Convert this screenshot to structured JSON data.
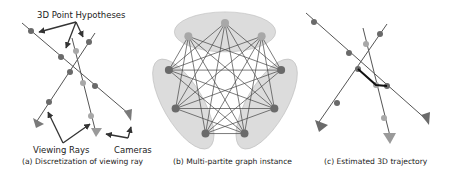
{
  "panels": {
    "a": {
      "caption": "(a) Discretization of viewing ray",
      "labels": {
        "hypotheses": "3D Point Hypotheses",
        "rays": "Viewing Rays",
        "cameras": "Cameras"
      }
    },
    "b": {
      "caption": "(b) Multi-partite graph instance",
      "partitions": 3,
      "nodes_per_partition": 3
    },
    "c": {
      "caption": "(c) Estimated 3D trajectory"
    }
  },
  "colors": {
    "ray": "#555555",
    "node_dark": "#6a6a6a",
    "node_light": "#a8a8a8",
    "camera_dark": "#7a7a7a",
    "camera_light": "#9a9a9a",
    "partition_fill": "#d0d0d0",
    "edge": "#444444",
    "path": "#111111"
  }
}
